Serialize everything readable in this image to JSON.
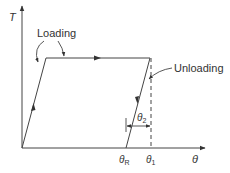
{
  "diagram": {
    "type": "stress-strain-hysteresis",
    "axes": {
      "y_label": "T",
      "x_label": "θ"
    },
    "annotations": {
      "loading": "Loading",
      "unloading": "Unloading"
    },
    "x_ticks": {
      "theta_R": {
        "base": "θ",
        "sub": "R"
      },
      "theta_1": {
        "base": "θ",
        "sub": "1"
      }
    },
    "dimension": {
      "base": "θ",
      "sub": "2"
    },
    "colors": {
      "line": "#333333",
      "background": "#ffffff"
    }
  }
}
